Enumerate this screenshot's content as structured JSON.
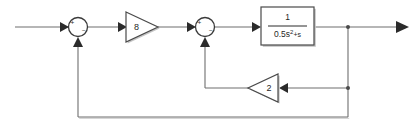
{
  "diagram": {
    "type": "control-system-block-diagram",
    "title": "",
    "colors": {
      "background": "#ffffff",
      "wire": "#6e6e6e",
      "outline": "#4a4a4a",
      "text": "#1f1f1f",
      "shadow": "#c4c4c4"
    },
    "signals": {
      "input_label": "",
      "output_label": ""
    },
    "summing_junctions": [
      {
        "name": "summer-1",
        "cx": 78,
        "cy": 27,
        "r": 9.5,
        "plus_sign": "+",
        "minus_sign": "−",
        "plus_pos": {
          "x": 72.5,
          "y": 23.5
        },
        "minus_pos": {
          "x": 83.5,
          "y": 30.5
        }
      },
      {
        "name": "summer-2",
        "cx": 205,
        "cy": 27,
        "r": 9.5,
        "plus_sign": "+",
        "minus_sign": "−",
        "plus_pos": {
          "x": 199.5,
          "y": 23.5
        },
        "minus_pos": {
          "x": 210.5,
          "y": 30.5
        }
      }
    ],
    "gain_blocks": [
      {
        "name": "forward-gain",
        "label": "8",
        "direction": "right",
        "x1": 126,
        "y1": 12,
        "x2": 158,
        "y2": 42,
        "label_x": 136,
        "label_y": 27
      },
      {
        "name": "inner-feedback-gain",
        "label": "2",
        "direction": "left",
        "x1": 248,
        "y1": 74,
        "x2": 278,
        "y2": 102,
        "label_x": 268,
        "label_y": 88
      }
    ],
    "transfer_function": {
      "name": "plant-block",
      "x": 261,
      "y": 7,
      "width": 53,
      "height": 38,
      "numerator": "1",
      "denominator_main": "0.5s",
      "denominator_exponent": "2",
      "denominator_tail": "+s",
      "full_expression": "1 / (0.5s^2 + s)"
    },
    "junction_dots": [
      {
        "name": "output-takeoff-dot",
        "cx": 348,
        "cy": 27,
        "r": 2.0
      },
      {
        "name": "inner-loop-takeoff-dot",
        "cx": 348,
        "cy": 88,
        "r": 2.0
      }
    ],
    "wires": [
      {
        "name": "input-wire",
        "path": "M 15 27 L 68 27"
      },
      {
        "name": "summer1-to-gain8",
        "path": "M 87.5 27 L 120 27"
      },
      {
        "name": "gain8-to-summer2",
        "path": "M 158 27 L 196 27"
      },
      {
        "name": "summer2-to-plant",
        "path": "M 214.5 27 L 255 27"
      },
      {
        "name": "plant-to-output",
        "path": "M 314 27 L 400 27"
      },
      {
        "name": "output-down-to-inner",
        "path": "M 348 27 L 348 88"
      },
      {
        "name": "inner-return-to-gain2",
        "path": "M 348 88 L 284 88"
      },
      {
        "name": "gain2-to-corner",
        "path": "M 248 88 L 205 88"
      },
      {
        "name": "inner-up-to-summer2",
        "path": "M 205 88 L 205 42"
      },
      {
        "name": "outer-down",
        "path": "M 348 88 L 348 117"
      },
      {
        "name": "outer-left",
        "path": "M 348 117 L 78 117"
      },
      {
        "name": "outer-up-to-summer1",
        "path": "M 78 117 L 78 42"
      }
    ],
    "arrowheads": [
      {
        "name": "arrow-into-summer1",
        "x": 68,
        "y": 27,
        "dir": "right"
      },
      {
        "name": "arrow-into-gain8",
        "x": 126,
        "y": 27,
        "dir": "right"
      },
      {
        "name": "arrow-into-summer2",
        "x": 196,
        "y": 27,
        "dir": "right"
      },
      {
        "name": "arrow-into-plant",
        "x": 261,
        "y": 27,
        "dir": "right"
      },
      {
        "name": "arrow-output",
        "x": 404,
        "y": 27,
        "dir": "right"
      },
      {
        "name": "arrow-into-gain2",
        "x": 280,
        "y": 88,
        "dir": "left"
      },
      {
        "name": "arrow-up-into-summer2",
        "x": 205,
        "y": 38,
        "dir": "up"
      },
      {
        "name": "arrow-up-into-summer1",
        "x": 78,
        "y": 38,
        "dir": "up"
      }
    ]
  }
}
